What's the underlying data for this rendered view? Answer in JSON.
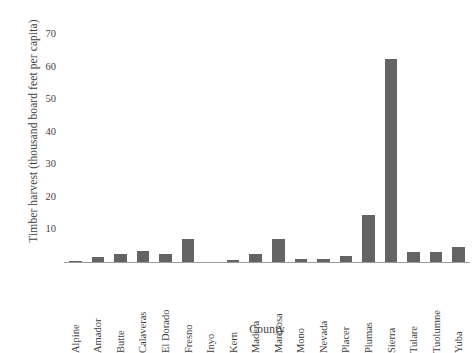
{
  "chart_data": {
    "type": "bar",
    "title": "",
    "xlabel": "County",
    "ylabel": "Timber harvest (thousand board feet per capita)",
    "categories": [
      "Alpine",
      "Amador",
      "Butte",
      "Calaveras",
      "El Dorado",
      "Fresno",
      "Inyo",
      "Kern",
      "Madera",
      "Mariposa",
      "Mono",
      "Nevada",
      "Placer",
      "Plumas",
      "Sierra",
      "Tulare",
      "Tuolumne",
      "Yuba"
    ],
    "values": [
      0.2,
      1.5,
      2.5,
      3.5,
      2.6,
      7.0,
      0.0,
      0.6,
      2.5,
      7.0,
      1.0,
      1.0,
      1.9,
      14.5,
      62.5,
      3.0,
      3.0,
      4.5
    ],
    "ylim": [
      0,
      75
    ],
    "yticks": [
      10,
      20,
      30,
      40,
      50,
      60,
      70
    ],
    "ytick_labels": [
      "10",
      "20",
      "30",
      "40",
      "50",
      "60",
      "70"
    ],
    "grid": false,
    "legend": "none",
    "bar_color": "#646464",
    "axis_color": "#9a9a9a",
    "text_color": "#3f3f3f"
  },
  "axes": {
    "y_title": "Timber harvest (thousand board feet per capita)",
    "x_title": "County"
  },
  "footer": {
    "caption": ""
  }
}
